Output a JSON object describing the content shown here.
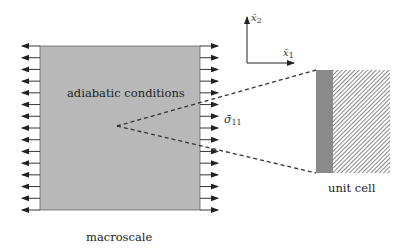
{
  "diagram": {
    "macroscale": {
      "label": "macroscale",
      "inner_label": "adiabatic conditions",
      "box": {
        "x": 40,
        "y": 46,
        "width": 160,
        "height": 164,
        "fill": "#b8b8b8",
        "stroke": "#555555"
      },
      "arrow_rows": 15,
      "arrow_length": 18,
      "left_arrows_direction": "outward-left",
      "right_arrows_direction": "outward-right"
    },
    "stress_label": {
      "symbol": "σ̄",
      "subscript": "11"
    },
    "axes": {
      "origin": {
        "x": 247,
        "y": 63
      },
      "x1_label": {
        "symbol": "x̄",
        "subscript": "1"
      },
      "x2_label": {
        "symbol": "x̄",
        "subscript": "2"
      }
    },
    "zoom_lines": {
      "from": {
        "x": 117,
        "y": 126
      },
      "to_top": {
        "x": 316,
        "y": 70
      },
      "to_bottom": {
        "x": 316,
        "y": 173
      },
      "style": "dashed"
    },
    "unit_cell": {
      "label": "unit cell",
      "box": {
        "x": 316,
        "y": 70,
        "width": 74,
        "height": 103
      },
      "solid_band": {
        "width": 17,
        "fill": "#8a8a8a"
      },
      "hatch_fill": "#ffffff",
      "hatch_stroke": "#555555"
    },
    "colors": {
      "arrow": "#333333",
      "dash": "#333333"
    }
  }
}
